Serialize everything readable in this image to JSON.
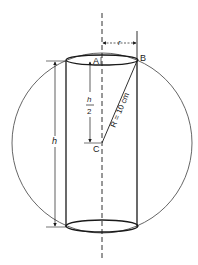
{
  "diagram": {
    "labels": {
      "point_a": "A",
      "point_b": "B",
      "point_c": "C",
      "radius_cyl": "r",
      "height": "h",
      "half_height_num": "h",
      "half_height_den": "2",
      "sphere_radius": "R = 10 cm"
    },
    "colors": {
      "stroke": "#1a1a1a",
      "circle": "#555555",
      "background": "#ffffff"
    }
  }
}
